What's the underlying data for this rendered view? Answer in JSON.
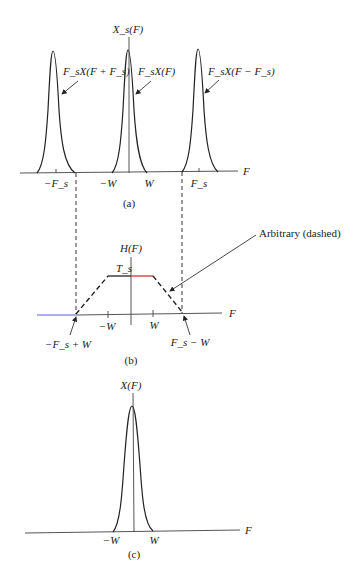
{
  "figure": {
    "panel_a": {
      "caption": "(a)",
      "y_axis_label": "X_s(F)",
      "x_axis_label": "F",
      "ticks": [
        "−F_s",
        "−W",
        "W",
        "F_s"
      ],
      "annotations": [
        "F_sX(F + F_s)",
        "F_sX(F)",
        "F_sX(F − F_s)"
      ]
    },
    "panel_b": {
      "caption": "(b)",
      "y_axis_label": "H(F)",
      "x_axis_label": "F",
      "level_label": "T_s",
      "ticks": [
        "−W",
        "W"
      ],
      "annotations": [
        "Arbitrary (dashed)",
        "−F_s + W",
        "F_s − W"
      ]
    },
    "panel_c": {
      "caption": "(c)",
      "y_axis_label": "X(F)",
      "x_axis_label": "F",
      "ticks": [
        "−W",
        "W"
      ]
    },
    "colors": {
      "ink": "#222222",
      "axis": "#555555",
      "passband_highlight": "#cc3333",
      "stopband_left": "#5566cc"
    }
  }
}
